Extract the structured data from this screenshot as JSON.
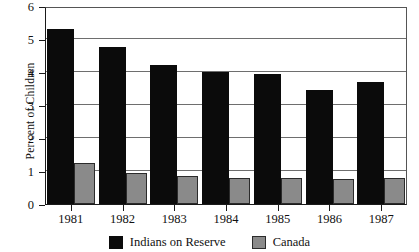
{
  "chart_data": {
    "type": "bar",
    "title": "",
    "xlabel": "",
    "ylabel": "Per cent of Children",
    "categories": [
      "1981",
      "1982",
      "1983",
      "1984",
      "1985",
      "1986",
      "1987"
    ],
    "series": [
      {
        "name": "Indians on Reserve",
        "color": "#0b0b0b",
        "values": [
          5.3,
          4.75,
          4.2,
          4.0,
          3.95,
          3.45,
          3.7
        ]
      },
      {
        "name": "Canada",
        "color": "#8a8a8a",
        "values": [
          1.25,
          0.95,
          0.85,
          0.8,
          0.8,
          0.75,
          0.8
        ]
      }
    ],
    "ylim": [
      0,
      6
    ],
    "yticks": [
      0,
      1,
      2,
      3,
      4,
      5,
      6
    ],
    "ytick_labels": [
      "0",
      "1",
      "2",
      "3",
      "4",
      "5",
      "6"
    ],
    "grid": "horizontal",
    "legend_position": "bottom-center"
  },
  "legend": {
    "items": [
      {
        "label": "Indians on Reserve",
        "swatch": "black-square-icon"
      },
      {
        "label": "Canada",
        "swatch": "grey-square-icon"
      }
    ]
  }
}
